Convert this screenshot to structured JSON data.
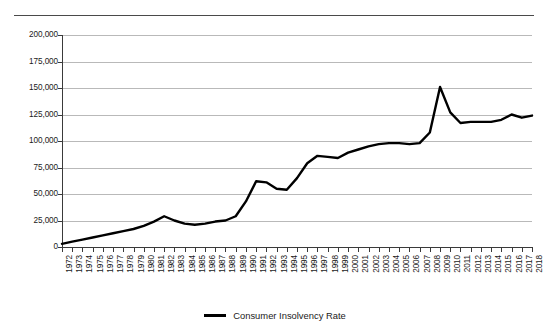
{
  "chart_data": {
    "type": "line",
    "title": "",
    "subtitle": "",
    "xlabel": "",
    "ylabel": "",
    "grid": true,
    "legend_position": "bottom-center",
    "ylim": [
      0,
      200000
    ],
    "ytick_labels": [
      "200,000",
      "175,000",
      "150,000",
      "125,000",
      "100,000",
      "75,000",
      "50,000",
      "25,000",
      "0"
    ],
    "ytick_values": [
      200000,
      175000,
      150000,
      125000,
      100000,
      75000,
      50000,
      25000,
      0
    ],
    "categories": [
      "1972",
      "1973",
      "1974",
      "1975",
      "1976",
      "1977",
      "1978",
      "1979",
      "1980",
      "1981",
      "1982",
      "1983",
      "1984",
      "1985",
      "1986",
      "1987",
      "1988",
      "1989",
      "1990",
      "1991",
      "1992",
      "1993",
      "1994",
      "1995",
      "1996",
      "1997",
      "1998",
      "1999",
      "2000",
      "2001",
      "2002",
      "2003",
      "2004",
      "2005",
      "2006",
      "2007",
      "2008",
      "2009",
      "2010",
      "2011",
      "2012",
      "2013",
      "2014",
      "2015",
      "2016",
      "2017",
      "2018"
    ],
    "series": [
      {
        "name": "Consumer Insolvency Rate",
        "color": "#000000",
        "values": [
          3000,
          5000,
          7000,
          9000,
          11000,
          13000,
          15000,
          17000,
          20000,
          24000,
          29000,
          25000,
          22000,
          21000,
          22000,
          24000,
          25000,
          29000,
          43000,
          62000,
          61000,
          55000,
          54000,
          65000,
          79000,
          86000,
          85000,
          84000,
          89000,
          92000,
          95000,
          97000,
          98000,
          98000,
          97000,
          98000,
          108000,
          151000,
          127000,
          117000,
          118000,
          118000,
          118000,
          120000,
          125000,
          122000,
          124000
        ]
      }
    ]
  },
  "legend": {
    "entries": [
      {
        "label": "Consumer Insolvency Rate",
        "marker": "line-swatch"
      }
    ]
  }
}
